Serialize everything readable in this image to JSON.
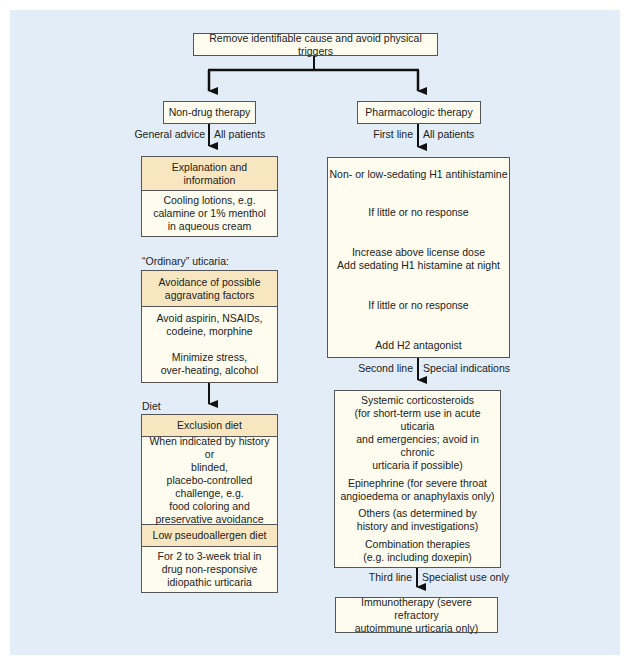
{
  "top": {
    "label": "Remove identifiable cause and avoid physical triggers"
  },
  "left": {
    "title": "Non-drug therapy",
    "branch_left": "General advice",
    "branch_right": "All patients",
    "explanation": {
      "header": [
        "Explanation and",
        "information"
      ],
      "body": [
        "Cooling lotions, e.g.",
        "calamine or 1% menthol",
        "in aqueous cream"
      ]
    },
    "ordinary_label": "“Ordinary” uticaria:",
    "avoidance": {
      "header": [
        "Avoidance of possible",
        "aggravating factors"
      ],
      "body1": [
        "Avoid aspirin, NSAIDs,",
        "codeine, morphine"
      ],
      "body2": [
        "Minimize stress,",
        "over-heating, alcohol"
      ]
    },
    "diet_label": "Diet",
    "exclusion": {
      "header": "Exclusion diet",
      "body": [
        "When indicated by history or",
        "blinded,",
        "placebo-controlled",
        "challenge, e.g.",
        "food coloring and",
        "preservative avoidance"
      ]
    },
    "pseudoallergen": {
      "header": "Low pseudoallergen diet",
      "body": [
        "For 2 to 3-week trial in",
        "drug non-responsive",
        "idiopathic urticaria"
      ]
    }
  },
  "right": {
    "title": "Pharmacologic therapy",
    "first_line": {
      "branch_left": "First line",
      "branch_right": "All patients",
      "steps": [
        [
          "Non- or low-sedating H1 antihistamine"
        ],
        [
          "If little or no response"
        ],
        [
          "Increase above license dose",
          "Add sedating H1 histamine at night"
        ],
        [
          "If little or no response"
        ],
        [
          "Add H2 antagonist"
        ]
      ]
    },
    "second_line": {
      "branch_left": "Second line",
      "branch_right": "Special indications",
      "items": [
        [
          "Systemic corticosteroids",
          "(for short-term use in acute uticaria",
          "and emergencies; avoid in chronic",
          "urticaria if possible)"
        ],
        [
          "Epinephrine (for severe throat",
          "angioedema or anaphylaxis only)"
        ],
        [
          "Others (as determined by",
          "history and investigations)"
        ],
        [
          "Combination therapies",
          "(e.g. including doxepin)"
        ]
      ]
    },
    "third_line": {
      "branch_left": "Third line",
      "branch_right": "Specialist use only",
      "box": [
        "Immunotherapy (severe refractory",
        "autoimmune urticaria only)"
      ]
    }
  },
  "colors": {
    "background": "#e3edf8",
    "header_fill": "#f7e6bf",
    "box_fill": "#fdfcef",
    "border": "#555555",
    "line": "#111111"
  }
}
